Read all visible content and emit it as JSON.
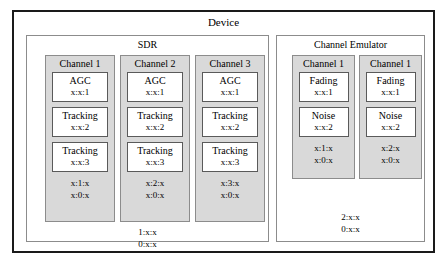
{
  "device": {
    "title": "Device",
    "groups": [
      {
        "id": "sdr",
        "title": "SDR",
        "channels": [
          {
            "title": "Channel 1",
            "modules": [
              {
                "name": "AGC",
                "addr": "x:x:1"
              },
              {
                "name": "Tracking",
                "addr": "x:x:2"
              },
              {
                "name": "Tracking",
                "addr": "x:x:3"
              }
            ],
            "footer": [
              "x:1:x",
              "x:0:x"
            ]
          },
          {
            "title": "Channel 2",
            "modules": [
              {
                "name": "AGC",
                "addr": "x:x:1"
              },
              {
                "name": "Tracking",
                "addr": "x:x:2"
              },
              {
                "name": "Tracking",
                "addr": "x:x:3"
              }
            ],
            "footer": [
              "x:2:x",
              "x:0:x"
            ]
          },
          {
            "title": "Channel 3",
            "modules": [
              {
                "name": "AGC",
                "addr": "x:x:1"
              },
              {
                "name": "Tracking",
                "addr": "x:x:2"
              },
              {
                "name": "Tracking",
                "addr": "x:x:3"
              }
            ],
            "footer": [
              "x:3:x",
              "x:0:x"
            ]
          }
        ],
        "footer": [
          "1:x:x",
          "0:x:x"
        ]
      },
      {
        "id": "emulator",
        "title": "Channel Emulator",
        "channels": [
          {
            "title": "Channel 1",
            "modules": [
              {
                "name": "Fading",
                "addr": "x:x:1"
              },
              {
                "name": "Noise",
                "addr": "x:x:2"
              }
            ],
            "footer": [
              "x:1:x",
              "x:0:x"
            ]
          },
          {
            "title": "Channel 1",
            "modules": [
              {
                "name": "Fading",
                "addr": "x:x:1"
              },
              {
                "name": "Noise",
                "addr": "x:x:2"
              }
            ],
            "footer": [
              "x:2:x",
              "x:0:x"
            ]
          }
        ],
        "footer": [
          "2:x:x",
          "0:x:x"
        ]
      }
    ]
  },
  "colors": {
    "device_border": "#1a1a1a",
    "group_border": "#8c8c8c",
    "channel_fill": "#d9d9d9",
    "module_fill": "#ffffff",
    "text": "#000000"
  }
}
